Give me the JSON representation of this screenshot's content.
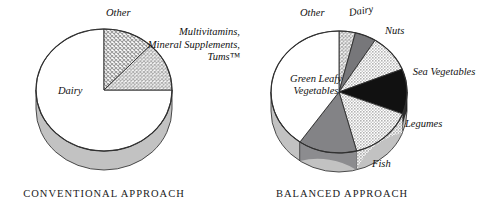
{
  "figure": {
    "background": "#ffffff",
    "ink": "#111111"
  },
  "charts": [
    {
      "id": "conventional",
      "caption": "CONVENTIONAL APPROACH",
      "caption_left": 18,
      "caption_top": 188,
      "caption_width": 172,
      "center": {
        "x": 104,
        "y": 90
      },
      "rx": 68,
      "ry": 61,
      "depth": 19,
      "labels": [
        {
          "name": "label-other",
          "text": "Other",
          "left": 106,
          "top": 7,
          "style": "plain"
        },
        {
          "name": "label-multivitamins",
          "text": "Multivitamins, Mineral Supplements, Tums™",
          "left": 146,
          "top": 26,
          "style": "multi"
        },
        {
          "name": "label-dairy",
          "text": "Dairy",
          "left": 58,
          "top": 85,
          "style": "plain"
        }
      ]
    },
    {
      "id": "balanced",
      "caption": "BALANCED APPROACH",
      "caption_left": 262,
      "caption_top": 188,
      "caption_width": 160,
      "center": {
        "x": 339,
        "y": 92
      },
      "rx": 68,
      "ry": 61,
      "depth": 19,
      "labels": [
        {
          "name": "label-other",
          "text": "Other",
          "left": 300,
          "top": 7,
          "style": "plain"
        },
        {
          "name": "label-dairy",
          "text": "Dairy",
          "left": 349,
          "top": 7,
          "style": "rot"
        },
        {
          "name": "label-nuts",
          "text": "Nuts",
          "left": 385,
          "top": 25,
          "style": "plain"
        },
        {
          "name": "label-sea-vegetables",
          "text": "Sea Vegetables",
          "left": 404,
          "top": 66,
          "style": "two"
        },
        {
          "name": "label-legumes",
          "text": "Legumes",
          "left": 405,
          "top": 118,
          "style": "plain"
        },
        {
          "name": "label-fish",
          "text": "Fish",
          "left": 372,
          "top": 158,
          "style": "plain"
        },
        {
          "name": "label-green-leafy",
          "text": "Green Leafy Vegetables",
          "left": 276,
          "top": 73,
          "style": "ctr"
        }
      ]
    }
  ],
  "chart_data": [
    {
      "type": "pie",
      "title": "CONVENTIONAL APPROACH",
      "id": "conventional",
      "legend": "inline-labels",
      "grid": false,
      "categories": [
        "Dairy",
        "Other",
        "Multivitamins, Mineral Supplements, Tums™"
      ],
      "values": [
        75,
        12,
        13
      ],
      "unit": "percent",
      "start_angle_deg": 0,
      "direction": "clockwise",
      "slices": [
        {
          "label": "Dairy",
          "value": 75,
          "fill": "white",
          "fill_color": "#ffffff",
          "start_deg": 90,
          "end_deg": 360
        },
        {
          "label": "Other",
          "value": 12,
          "fill": "coarse-dot-hatch",
          "fill_color": "#c9c9c9",
          "start_deg": 0,
          "end_deg": 43
        },
        {
          "label": "Multivitamins, Mineral Supplements, Tums™",
          "value": 13,
          "fill": "cross-hatch-grid",
          "fill_color": "#d8d8d8",
          "start_deg": 43,
          "end_deg": 90
        }
      ]
    },
    {
      "type": "pie",
      "title": "BALANCED APPROACH",
      "id": "balanced",
      "legend": "inline-labels",
      "grid": false,
      "categories": [
        "Green Leafy Vegetables",
        "Other",
        "Dairy",
        "Nuts",
        "Sea Vegetables",
        "Legumes",
        "Fish"
      ],
      "values": [
        40,
        4,
        5,
        10,
        12,
        15,
        14
      ],
      "unit": "percent",
      "start_angle_deg": 0,
      "direction": "clockwise",
      "slices": [
        {
          "label": "Other",
          "value": 4,
          "fill": "cross-hatch-grid",
          "fill_color": "#d8d8d8",
          "start_deg": 0,
          "end_deg": 14
        },
        {
          "label": "Dairy",
          "value": 5,
          "fill": "solid-dark-gray",
          "fill_color": "#77777a",
          "start_deg": 14,
          "end_deg": 32
        },
        {
          "label": "Nuts",
          "value": 10,
          "fill": "light-dot",
          "fill_color": "#cfcfcf",
          "start_deg": 32,
          "end_deg": 68
        },
        {
          "label": "Sea Vegetables",
          "value": 12,
          "fill": "solid-black",
          "fill_color": "#111111",
          "start_deg": 68,
          "end_deg": 111
        },
        {
          "label": "Legumes",
          "value": 15,
          "fill": "light-dot",
          "fill_color": "#cfcfcf",
          "start_deg": 111,
          "end_deg": 165
        },
        {
          "label": "Fish",
          "value": 14,
          "fill": "solid-mid-gray",
          "fill_color": "#838386",
          "start_deg": 165,
          "end_deg": 215
        },
        {
          "label": "Green Leafy Vegetables",
          "value": 40,
          "fill": "white",
          "fill_color": "#ffffff",
          "start_deg": 215,
          "end_deg": 360
        }
      ]
    }
  ]
}
